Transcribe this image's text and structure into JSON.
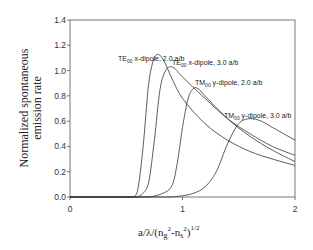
{
  "chart_data": {
    "type": "line",
    "title": "",
    "xlabel": "a/λ/(ng²-ns²)^1/2",
    "ylabel": "Normalized spontaneous emission rate",
    "xlim": [
      0,
      2
    ],
    "ylim": [
      0,
      1.4
    ],
    "x_ticks": [
      "0",
      "1",
      "2"
    ],
    "y_ticks": [
      "0.0",
      "0.2",
      "0.4",
      "0.6",
      "0.8",
      "1.0",
      "1.2",
      "1.4"
    ],
    "grid": false,
    "legend": "inline annotations",
    "series": [
      {
        "name": "TE00 x-dipole, 2.0 a/b",
        "x": [
          0.55,
          0.6,
          0.65,
          0.7,
          0.75,
          0.8,
          0.85,
          0.9,
          1.0,
          1.2,
          1.4,
          1.6,
          1.8,
          2.0
        ],
        "values": [
          0.0,
          0.05,
          0.4,
          0.9,
          1.1,
          1.12,
          1.05,
          0.95,
          0.78,
          0.58,
          0.45,
          0.36,
          0.3,
          0.25
        ]
      },
      {
        "name": "TE00 x-dipole, 3.0 a/b",
        "x": [
          0.6,
          0.65,
          0.7,
          0.75,
          0.8,
          0.85,
          0.9,
          0.95,
          1.0,
          1.2,
          1.4,
          1.6,
          1.8,
          2.0
        ],
        "values": [
          0.0,
          0.03,
          0.12,
          0.45,
          0.85,
          1.0,
          1.03,
          1.0,
          0.95,
          0.78,
          0.62,
          0.5,
          0.4,
          0.33
        ]
      },
      {
        "name": "TM00 y-dipole, 2.0 a/b",
        "x": [
          0.7,
          0.8,
          0.9,
          0.95,
          1.0,
          1.05,
          1.1,
          1.15,
          1.2,
          1.4,
          1.6,
          1.8,
          2.0
        ],
        "values": [
          0.0,
          0.02,
          0.08,
          0.25,
          0.55,
          0.78,
          0.86,
          0.85,
          0.8,
          0.62,
          0.48,
          0.37,
          0.28
        ]
      },
      {
        "name": "TM00 y-dipole, 3.0 a/b",
        "x": [
          0.9,
          1.0,
          1.1,
          1.2,
          1.3,
          1.4,
          1.5,
          1.6,
          1.7,
          1.8,
          1.9,
          2.0
        ],
        "values": [
          0.0,
          0.01,
          0.03,
          0.08,
          0.2,
          0.42,
          0.58,
          0.62,
          0.6,
          0.55,
          0.5,
          0.45
        ]
      }
    ]
  },
  "labels": {
    "s1": {
      "pre": "TE",
      "sub": "00",
      "post": " x-dipole, 2.0 a/b"
    },
    "s2": {
      "pre": "TE",
      "sub": "00",
      "post": " x-dipole, 3.0 a/b"
    },
    "s3": {
      "pre": "TM",
      "sub": "00",
      "post": " y-dipole, 2.0 a/b"
    },
    "s4": {
      "pre": "TM",
      "sub": "00",
      "post": " y-dipole, 3.0 a/b"
    }
  },
  "axis": {
    "ylabel_line1": "Normalized spontaneous",
    "ylabel_line2": "emission rate",
    "xlabel_main": "a/λ/(n",
    "xlabel_g": "g",
    "xlabel_sup2a": "2",
    "xlabel_mid": "-n",
    "xlabel_s": "s",
    "xlabel_sup2b": "2",
    "xlabel_close": ")",
    "xlabel_sup": "1/2"
  }
}
